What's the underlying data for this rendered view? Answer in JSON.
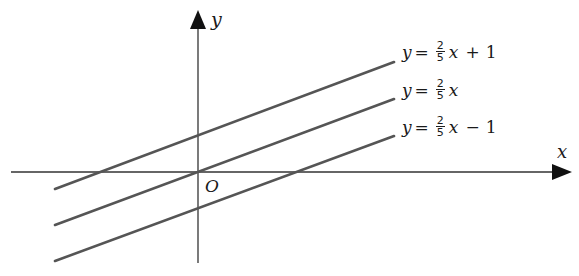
{
  "diagram": {
    "axes": {
      "x_label": "x",
      "y_label": "y",
      "origin_label": "O"
    },
    "lines": [
      {
        "label": {
          "lhs": "y",
          "eq": "=",
          "num": "2",
          "den": "5",
          "var": "x",
          "op": "+",
          "const": "1"
        },
        "slope": 0.4,
        "intercept": 1
      },
      {
        "label": {
          "lhs": "y",
          "eq": "=",
          "num": "2",
          "den": "5",
          "var": "x",
          "op": "",
          "const": ""
        },
        "slope": 0.4,
        "intercept": 0
      },
      {
        "label": {
          "lhs": "y",
          "eq": "=",
          "num": "2",
          "den": "5",
          "var": "x",
          "op": "−",
          "const": "1"
        },
        "slope": 0.4,
        "intercept": -1
      }
    ],
    "colors": {
      "axis": "#333333",
      "line": "#555555",
      "text": "#1a1a1a"
    }
  }
}
